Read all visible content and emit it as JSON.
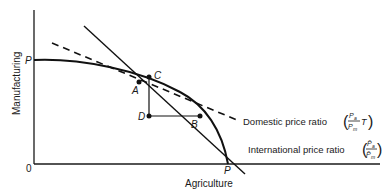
{
  "diagram": {
    "type": "production-possibility-frontier",
    "axes": {
      "x_label": "Agriculture",
      "y_label": "Manufacturing",
      "origin_label": "0"
    },
    "curve": {
      "name": "production possibility frontier",
      "y_intercept_label": "P",
      "x_intercept_label": "P"
    },
    "points": {
      "A": "A",
      "B": "B",
      "C": "C",
      "D": "D"
    },
    "lines": {
      "domestic": {
        "label": "Domestic price ratio",
        "numerator": "P",
        "numerator_sub": "a",
        "denominator": "P",
        "denominator_sub": "m",
        "multiplier": "T",
        "style": "dashed"
      },
      "international": {
        "label": "International price ratio",
        "numerator": "P̄",
        "numerator_sub": "a",
        "denominator": "P̄",
        "denominator_sub": "m",
        "style": "solid"
      }
    }
  }
}
